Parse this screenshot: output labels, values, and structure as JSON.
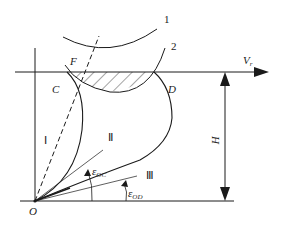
{
  "diagram": {
    "labels": {
      "arc1": "1",
      "arc2": "2",
      "point_F": "F",
      "point_C": "C",
      "point_D": "D",
      "origin": "O",
      "velocity": "V",
      "velocity_sub": "r",
      "height": "H",
      "region_I": "Ⅰ",
      "region_II": "Ⅱ",
      "region_III": "Ⅲ",
      "angle_oc": "ε",
      "angle_oc_sub": "OC",
      "angle_od": "ε",
      "angle_od_sub": "OD"
    },
    "colors": {
      "ink": "#1a1a1a",
      "background": "#ffffff"
    }
  }
}
